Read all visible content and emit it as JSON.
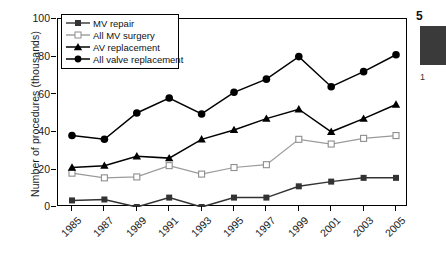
{
  "chart_data": {
    "type": "line",
    "title": "",
    "xlabel": "",
    "ylabel": "Number of procedures (thousands)",
    "categories": [
      "1985",
      "1987",
      "1989",
      "1991",
      "1993",
      "1995",
      "1997",
      "1999",
      "2001",
      "2003",
      "2005"
    ],
    "ylim": [
      0,
      100
    ],
    "yticks": [
      0,
      20,
      40,
      60,
      80,
      100
    ],
    "grid": false,
    "legend_position": "top-left",
    "series": [
      {
        "name": "MV repair",
        "marker": "filled-square",
        "color": "#333333",
        "values": [
          3.5,
          4,
          0,
          5,
          0,
          5,
          5,
          11,
          13.5,
          15.5,
          15.5
        ]
      },
      {
        "name": "All MV surgery",
        "marker": "open-square",
        "color": "#9a9a9a",
        "values": [
          18,
          15.5,
          16,
          22,
          17.5,
          21,
          22.5,
          36,
          33.5,
          36.5,
          38
        ]
      },
      {
        "name": "AV replacement",
        "marker": "filled-triangle",
        "color": "#000000",
        "values": [
          21,
          22,
          27,
          26,
          36,
          41,
          47,
          52,
          40,
          47,
          54.5
        ]
      },
      {
        "name": "All valve replacement",
        "marker": "filled-circle",
        "color": "#000000",
        "values": [
          38,
          36,
          50,
          58,
          49.5,
          61,
          68,
          80,
          64,
          72,
          81
        ]
      }
    ]
  },
  "legend": {
    "items": [
      {
        "label": "MV repair",
        "marker": "filled-square"
      },
      {
        "label": "All MV surgery",
        "marker": "open-square"
      },
      {
        "label": "AV replacement",
        "marker": "filled-triangle"
      },
      {
        "label": "All valve replacement",
        "marker": "filled-circle"
      }
    ]
  },
  "right_column": {
    "number": "5",
    "sub": "1",
    "vertical_text": "• • • • • • • • • • • • •"
  }
}
